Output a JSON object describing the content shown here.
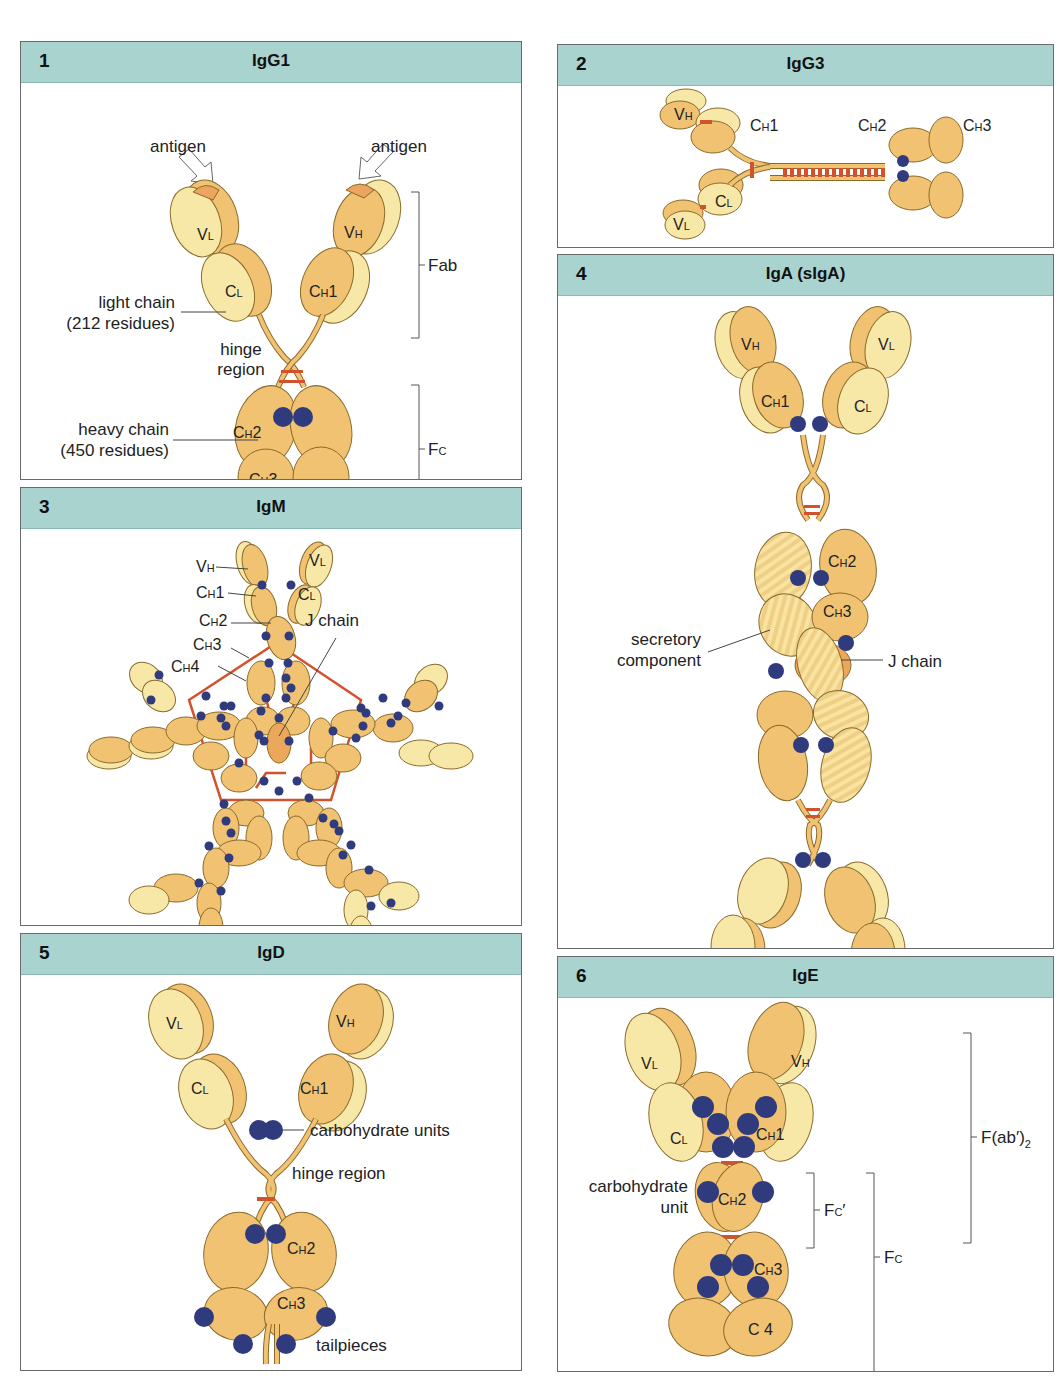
{
  "figure": {
    "colors": {
      "header_bg": "#a9d3cf",
      "light_chain_domain": "#f8e8a8",
      "heavy_chain_domain": "#f0c272",
      "antigen_site": "#eba55e",
      "j_chain": "#eca85a",
      "carbohydrate": "#2f3b7c",
      "disulfide_bond": "#d4522b",
      "outline": "#8a6a2a"
    },
    "panels": [
      {
        "number": "1",
        "title": "IgG1",
        "labels": {
          "antigen_left": "antigen",
          "antigen_right": "antigen",
          "vl": "V",
          "vl_sub": "L",
          "vh": "V",
          "vh_sub": "H",
          "cl": "C",
          "cl_sub": "L",
          "ch1": "C",
          "ch1_sub": "H",
          "ch1_num": "1",
          "ch2": "C",
          "ch2_sub": "H",
          "ch2_num": "2",
          "ch3": "C",
          "ch3_sub": "H",
          "ch3_num": "3",
          "light_chain_1": "light chain",
          "light_chain_2": "(212 residues)",
          "hinge_1": "hinge",
          "hinge_2": "region",
          "heavy_chain_1": "heavy chain",
          "heavy_chain_2": "(450 residues)",
          "fab": "Fab",
          "fc": "F",
          "fc_sub": "C"
        }
      },
      {
        "number": "2",
        "title": "IgG3",
        "labels": {
          "vh": "V",
          "vh_sub": "H",
          "vl": "V",
          "vl_sub": "L",
          "cl": "C",
          "cl_sub": "L",
          "ch1": "C",
          "ch1_sub": "H",
          "ch1_num": "1",
          "ch2": "C",
          "ch2_sub": "H",
          "ch2_num": "2",
          "ch3": "C",
          "ch3_sub": "H",
          "ch3_num": "3"
        }
      },
      {
        "number": "3",
        "title": "IgM",
        "labels": {
          "vh": "V",
          "vh_sub": "H",
          "vl": "V",
          "vl_sub": "L",
          "ch1": "C",
          "ch1_sub": "H",
          "ch1_num": "1",
          "cl": "C",
          "cl_sub": "L",
          "ch2": "C",
          "ch2_sub": "H",
          "ch2_num": "2",
          "ch3": "C",
          "ch3_sub": "H",
          "ch3_num": "3",
          "ch4": "C",
          "ch4_sub": "H",
          "ch4_num": "4",
          "j_chain": "J chain"
        }
      },
      {
        "number": "4",
        "title": "IgA (sIgA)",
        "labels": {
          "vh": "V",
          "vh_sub": "H",
          "vl": "V",
          "vl_sub": "L",
          "ch1": "C",
          "ch1_sub": "H",
          "ch1_num": "1",
          "cl": "C",
          "cl_sub": "L",
          "ch2": "C",
          "ch2_sub": "H",
          "ch2_num": "2",
          "ch3": "C",
          "ch3_sub": "H",
          "ch3_num": "3",
          "secretory_1": "secretory",
          "secretory_2": "component",
          "j_chain": "J chain"
        }
      },
      {
        "number": "5",
        "title": "IgD",
        "labels": {
          "vl": "V",
          "vl_sub": "L",
          "vh": "V",
          "vh_sub": "H",
          "cl": "C",
          "cl_sub": "L",
          "ch1": "C",
          "ch1_sub": "H",
          "ch1_num": "1",
          "ch2": "C",
          "ch2_sub": "H",
          "ch2_num": "2",
          "ch3": "C",
          "ch3_sub": "H",
          "ch3_num": "3",
          "carbohydrate_units": "carbohydrate units",
          "hinge_region": "hinge region",
          "tailpieces": "tailpieces"
        }
      },
      {
        "number": "6",
        "title": "IgE",
        "labels": {
          "vl": "V",
          "vl_sub": "L",
          "vh": "V",
          "vh_sub": "H",
          "cl": "C",
          "cl_sub": "L",
          "ch1": "C",
          "ch1_sub": "H",
          "ch1_num": "1",
          "ch2": "C",
          "ch2_sub": "H",
          "ch2_num": "2",
          "ch3": "C",
          "ch3_sub": "H",
          "ch3_num": "3",
          "c4": "C 4",
          "carbohydrate_1": "carbohydrate",
          "carbohydrate_2": "unit",
          "fab2": "F(ab′)",
          "fab2_sub": "2",
          "fc_prime": "F",
          "fc_prime_sub": "C",
          "fc_prime_mark": "′",
          "fc": "F",
          "fc_sub": "C"
        }
      }
    ]
  }
}
